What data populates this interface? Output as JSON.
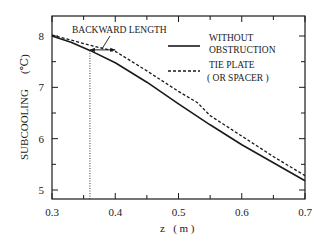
{
  "chart_data": {
    "type": "line",
    "title": "",
    "xlabel": "z   ( m )",
    "ylabel": "SUBCOOLING   (℃)",
    "xlim": [
      0.3,
      0.7
    ],
    "ylim": [
      4.85,
      8.35
    ],
    "x_ticks": [
      0.3,
      0.4,
      0.5,
      0.6,
      0.7
    ],
    "x_tick_labels": [
      "0.3",
      "0.4",
      "0.5",
      "0.6",
      "0.7"
    ],
    "x_minor_ticks": [
      0.35,
      0.45,
      0.55,
      0.65
    ],
    "y_ticks": [
      5,
      6,
      7,
      8
    ],
    "y_tick_labels": [
      "5",
      "6",
      "7",
      "8"
    ],
    "y_minor_ticks": [
      5.5,
      6.5,
      7.5
    ],
    "grid": false,
    "legend_position": "upper right (inside)",
    "series": [
      {
        "name": "WITHOUT OBSTRUCTION",
        "style": "solid",
        "x": [
          0.3,
          0.33,
          0.36,
          0.4,
          0.45,
          0.5,
          0.55,
          0.6,
          0.65,
          0.7
        ],
        "y": [
          8.0,
          7.88,
          7.72,
          7.48,
          7.1,
          6.68,
          6.27,
          5.88,
          5.53,
          5.18
        ]
      },
      {
        "name": "TIE PLATE ( OR SPACER )",
        "style": "dashed",
        "x": [
          0.3,
          0.33,
          0.36,
          0.4,
          0.42,
          0.45,
          0.5,
          0.53,
          0.55,
          0.6,
          0.65,
          0.7
        ],
        "y": [
          8.02,
          7.92,
          7.82,
          7.7,
          7.55,
          7.32,
          6.92,
          6.7,
          6.45,
          6.05,
          5.65,
          5.28
        ]
      }
    ],
    "annotations": [
      {
        "text": "BACKWARD LENGTH",
        "type": "double-arrow",
        "x_from": 0.36,
        "x_to": 0.4,
        "y": 7.72
      },
      {
        "type": "vertical-dotted-line",
        "x": 0.36,
        "y_from": 4.85,
        "y_to": 7.72
      }
    ]
  },
  "legend": {
    "solid_line_1": "WITHOUT",
    "solid_line_2": "OBSTRUCTION",
    "dashed_line_1": "TIE PLATE",
    "dashed_line_2": "( OR SPACER )"
  },
  "labels": {
    "annotation": "BACKWARD LENGTH",
    "xlabel": "z   ( m )",
    "ylabel": "SUBCOOLING",
    "yunit": "(℃)"
  }
}
